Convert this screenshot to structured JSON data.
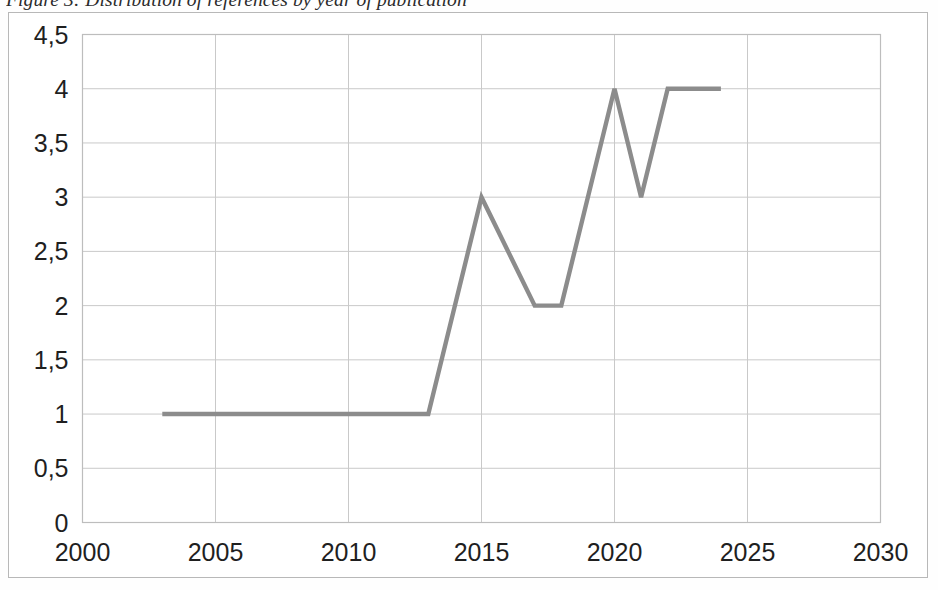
{
  "figure": {
    "caption": "Figure 3: Distribution of references by year of publication",
    "caption_clipped": "true"
  },
  "chart_data": {
    "type": "line",
    "title": "Figure 3: Distribution of references by year of publication",
    "xlabel": "",
    "ylabel": "",
    "xlim": [
      2000,
      2030
    ],
    "ylim": [
      0,
      4.5
    ],
    "grid": "both",
    "legend": "none",
    "x": [
      2003,
      2004,
      2005,
      2006,
      2007,
      2008,
      2009,
      2010,
      2011,
      2012,
      2013,
      2015,
      2017,
      2018,
      2020,
      2021,
      2022,
      2023,
      2024
    ],
    "values": [
      1,
      1,
      1,
      1,
      1,
      1,
      1,
      1,
      1,
      1,
      1,
      3,
      2,
      2,
      4,
      3,
      4,
      4,
      4
    ],
    "series": [
      {
        "name": "References",
        "color": "#8c8c8c",
        "points": [
          {
            "x": 2003,
            "y": 1
          },
          {
            "x": 2013,
            "y": 1
          },
          {
            "x": 2015,
            "y": 3
          },
          {
            "x": 2017,
            "y": 2
          },
          {
            "x": 2018,
            "y": 2
          },
          {
            "x": 2020,
            "y": 4
          },
          {
            "x": 2021,
            "y": 3
          },
          {
            "x": 2022,
            "y": 4
          },
          {
            "x": 2024,
            "y": 4
          }
        ]
      }
    ],
    "x_tick_labels": [
      "2000",
      "2005",
      "2010",
      "2015",
      "2020",
      "2025",
      "2030"
    ],
    "x_tick_values": [
      2000,
      2005,
      2010,
      2015,
      2020,
      2025,
      2030
    ],
    "y_tick_labels": [
      "0",
      "0,5",
      "1",
      "1,5",
      "2",
      "2,5",
      "3",
      "3,5",
      "4",
      "4,5"
    ],
    "y_tick_values": [
      0,
      0.5,
      1,
      1.5,
      2,
      2.5,
      3,
      3.5,
      4,
      4.5
    ],
    "colors": {
      "line": "#8c8c8c",
      "gridline": "#c9c9c9",
      "plot_frame": "#bdbdbd",
      "outer_border": "#b8b8b8",
      "tick_text": "#1f1f1f",
      "background": "#ffffff"
    }
  }
}
